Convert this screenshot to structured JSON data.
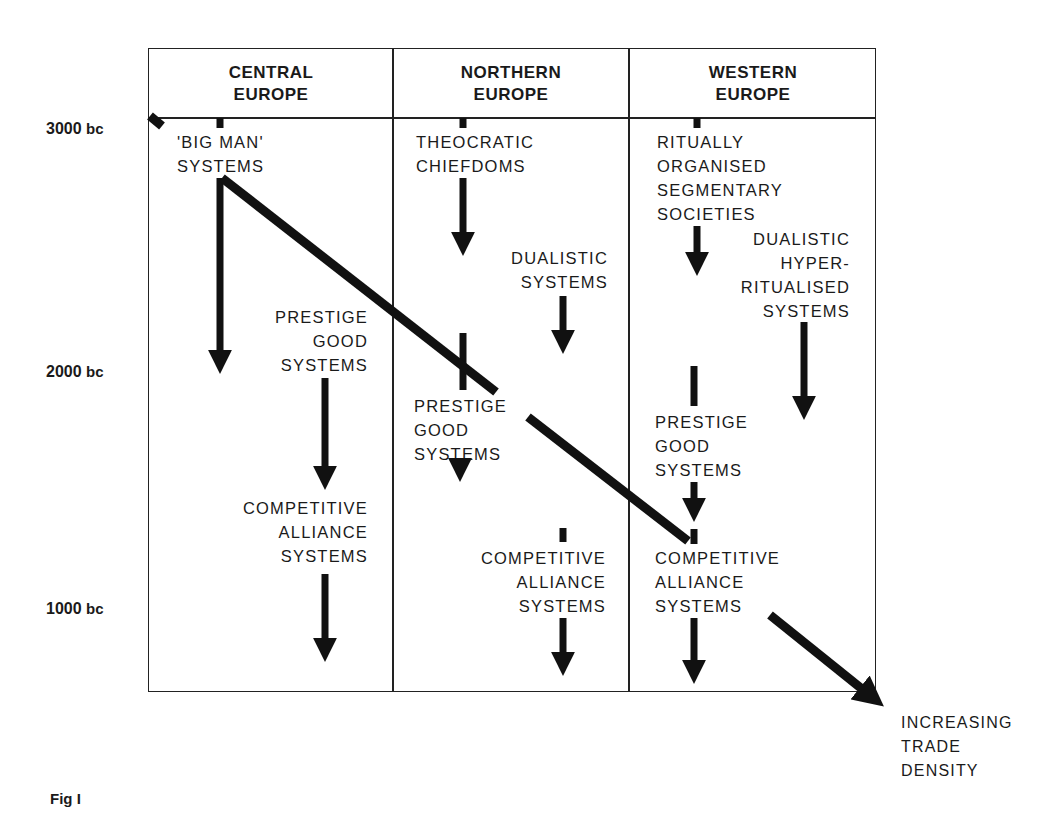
{
  "figure": {
    "caption": "Fig I",
    "y_axis": {
      "ticks": [
        {
          "value": "3000",
          "unit": "bc"
        },
        {
          "value": "2000",
          "unit": "bc"
        },
        {
          "value": "1000",
          "unit": "bc"
        }
      ]
    },
    "columns": [
      {
        "header_line1": "CENTRAL",
        "header_line2": "EUROPE"
      },
      {
        "header_line1": "NORTHERN",
        "header_line2": "EUROPE"
      },
      {
        "header_line1": "WESTERN",
        "header_line2": "EUROPE"
      }
    ],
    "nodes": {
      "central_big_man": [
        "'BIG MAN'",
        "SYSTEMS"
      ],
      "central_prestige": [
        "PRESTIGE",
        "GOOD",
        "SYSTEMS"
      ],
      "central_competitive": [
        "COMPETITIVE",
        "ALLIANCE",
        "SYSTEMS"
      ],
      "northern_theocratic": [
        "THEOCRATIC",
        "CHIEFDOMS"
      ],
      "northern_dualistic": [
        "DUALISTIC",
        "SYSTEMS"
      ],
      "northern_prestige": [
        "PRESTIGE",
        "GOOD",
        "SYSTEMS"
      ],
      "northern_competitive": [
        "COMPETITIVE",
        "ALLIANCE",
        "SYSTEMS"
      ],
      "western_ritually": [
        "RITUALLY",
        "ORGANISED",
        "SEGMENTARY",
        "SOCIETIES"
      ],
      "western_dualistic": [
        "DUALISTIC",
        "HYPER-",
        "RITUALISED",
        "SYSTEMS"
      ],
      "western_prestige": [
        "PRESTIGE",
        "GOOD",
        "SYSTEMS"
      ],
      "western_competitive": [
        "COMPETITIVE",
        "ALLIANCE",
        "SYSTEMS"
      ]
    },
    "trend_arrow_label": [
      "INCREASING",
      "TRADE",
      "DENSITY"
    ]
  }
}
